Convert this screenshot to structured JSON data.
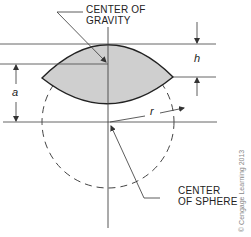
{
  "diagram": {
    "labels": {
      "center_of_gravity_line1": "CENTER OF",
      "center_of_gravity_line2": "GRAVITY",
      "center_of_sphere_line1": "CENTER",
      "center_of_sphere_line2": "OF SPHERE"
    },
    "dimensions": {
      "h": "h",
      "a": "a",
      "r": "r"
    },
    "copyright": "© Cengage Learning 2013",
    "colors": {
      "lens_fill": "#cfcfcf",
      "stroke": "#333333"
    }
  }
}
